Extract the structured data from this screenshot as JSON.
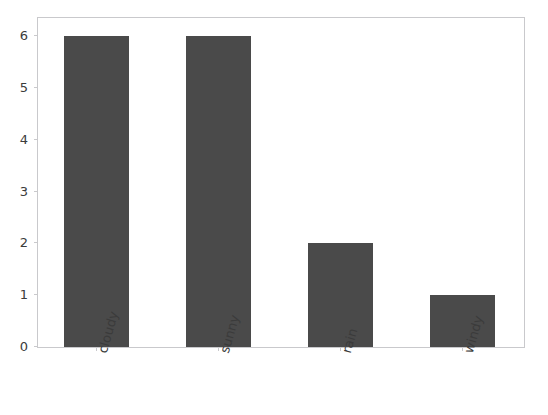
{
  "chart_data": {
    "type": "bar",
    "title": "",
    "subtitle": "",
    "xlabel": "",
    "ylabel": "",
    "categories": [
      "cloudy",
      "sunny",
      "rain",
      "windy"
    ],
    "values": [
      6,
      6,
      2,
      1
    ],
    "series": [
      {
        "name": "count",
        "values": [
          6,
          6,
          2,
          1
        ]
      }
    ],
    "ylim": [
      0,
      6.35
    ],
    "yticks": [
      0,
      1,
      2,
      3,
      4,
      5,
      6
    ],
    "ytick_labels": [
      "0",
      "1",
      "2",
      "3",
      "4",
      "5",
      "6"
    ],
    "xtick_labels": [
      "cloudy",
      "sunny",
      "rain",
      "windy"
    ],
    "xtick_rotation": -74,
    "grid": false,
    "legend": false,
    "legend_position": "none",
    "bar_color": "#4a4a4a",
    "spine_color": "#c9c9cc",
    "tick_label_color": "#3b3b3b",
    "background_color": "#ffffff"
  }
}
